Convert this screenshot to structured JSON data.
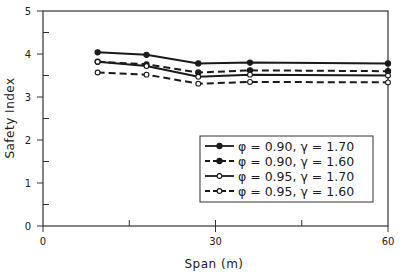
{
  "chart_data": {
    "type": "line",
    "title": "",
    "xlabel": "Span (m)",
    "ylabel": "Safety Index",
    "xlim": [
      0,
      60
    ],
    "ylim": [
      0,
      5
    ],
    "x_ticks": [
      0,
      30,
      60
    ],
    "x_minor_ticks": [
      15,
      45
    ],
    "y_ticks": [
      0,
      1,
      2,
      3,
      4,
      5
    ],
    "y_minor_ticks": [
      0.5,
      1.5,
      2.5,
      3.5,
      4.5
    ],
    "grid": false,
    "legend_position": "lower right (inside)",
    "x": [
      9.5,
      18,
      27,
      36,
      60
    ],
    "series": [
      {
        "name": "φ = 0.90, γ = 1.70",
        "line": "solid",
        "marker": "filled-circle",
        "values": [
          4.04,
          3.98,
          3.78,
          3.8,
          3.78
        ]
      },
      {
        "name": "φ = 0.90, γ = 1.60",
        "line": "dashed",
        "marker": "filled-circle",
        "values": [
          3.82,
          3.76,
          3.57,
          3.62,
          3.6
        ]
      },
      {
        "name": "φ = 0.95, γ = 1.70",
        "line": "solid",
        "marker": "open-circle",
        "values": [
          3.82,
          3.72,
          3.47,
          3.52,
          3.5
        ]
      },
      {
        "name": "φ = 0.95, γ = 1.60",
        "line": "dashed",
        "marker": "open-circle",
        "values": [
          3.57,
          3.52,
          3.31,
          3.35,
          3.34
        ]
      }
    ]
  },
  "axes": {
    "x_label": "Span (m)",
    "y_label": "Safety Index",
    "x_tick_labels": [
      "0",
      "30",
      "60"
    ],
    "y_tick_labels": [
      "0",
      "1",
      "2",
      "3",
      "4",
      "5"
    ]
  },
  "legend": {
    "items": [
      {
        "label": "φ = 0.90, γ = 1.70"
      },
      {
        "label": "φ = 0.90, γ = 1.60"
      },
      {
        "label": "φ = 0.95, γ = 1.70"
      },
      {
        "label": "φ = 0.95, γ = 1.60"
      }
    ]
  },
  "colors": {
    "line": "#1a1a1a",
    "frame": "#333333",
    "background": "#ffffff"
  }
}
